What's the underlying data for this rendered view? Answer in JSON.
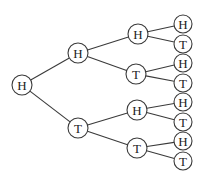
{
  "diagram": {
    "type": "probability-tree",
    "levels": 4,
    "nodes": [
      {
        "id": "n0",
        "label": "H",
        "x": 22,
        "y": 85,
        "r": 10
      },
      {
        "id": "n1",
        "label": "H",
        "x": 78,
        "y": 53,
        "r": 10
      },
      {
        "id": "n2",
        "label": "T",
        "x": 78,
        "y": 128,
        "r": 10
      },
      {
        "id": "n3",
        "label": "H",
        "x": 138,
        "y": 34,
        "r": 10
      },
      {
        "id": "n4",
        "label": "T",
        "x": 136,
        "y": 74,
        "r": 10
      },
      {
        "id": "n5",
        "label": "H",
        "x": 137,
        "y": 110,
        "r": 10
      },
      {
        "id": "n6",
        "label": "T",
        "x": 137,
        "y": 148,
        "r": 10
      },
      {
        "id": "n7",
        "label": "H",
        "x": 183,
        "y": 24,
        "r": 9
      },
      {
        "id": "n8",
        "label": "T",
        "x": 183,
        "y": 44,
        "r": 9
      },
      {
        "id": "n9",
        "label": "H",
        "x": 183,
        "y": 63,
        "r": 9
      },
      {
        "id": "n10",
        "label": "T",
        "x": 183,
        "y": 83,
        "r": 9
      },
      {
        "id": "n11",
        "label": "H",
        "x": 183,
        "y": 102,
        "r": 9
      },
      {
        "id": "n12",
        "label": "T",
        "x": 183,
        "y": 122,
        "r": 9
      },
      {
        "id": "n13",
        "label": "H",
        "x": 183,
        "y": 141,
        "r": 9
      },
      {
        "id": "n14",
        "label": "T",
        "x": 183,
        "y": 161,
        "r": 9
      }
    ],
    "edges": [
      [
        "n0",
        "n1"
      ],
      [
        "n0",
        "n2"
      ],
      [
        "n1",
        "n3"
      ],
      [
        "n1",
        "n4"
      ],
      [
        "n2",
        "n5"
      ],
      [
        "n2",
        "n6"
      ],
      [
        "n3",
        "n7"
      ],
      [
        "n3",
        "n8"
      ],
      [
        "n4",
        "n9"
      ],
      [
        "n4",
        "n10"
      ],
      [
        "n5",
        "n11"
      ],
      [
        "n5",
        "n12"
      ],
      [
        "n6",
        "n13"
      ],
      [
        "n6",
        "n14"
      ]
    ]
  }
}
